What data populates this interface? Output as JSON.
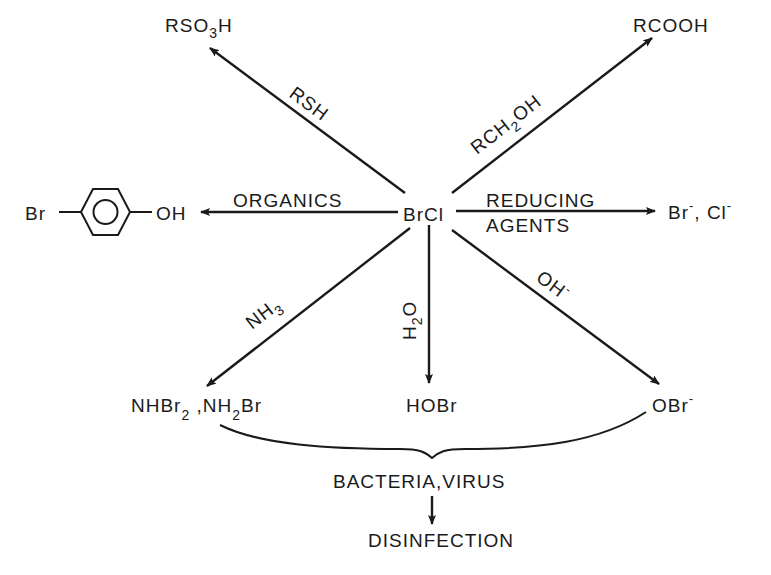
{
  "diagram": {
    "type": "reaction-scheme",
    "center": {
      "label": "BrCl"
    },
    "reactions": [
      {
        "reagent": "RSH",
        "product": "RSO3H",
        "product_parts": [
          "RSO",
          "3",
          "H"
        ],
        "direction": "upper-left"
      },
      {
        "reagent": "RCH2OH",
        "reagent_parts": [
          "RCH",
          "2",
          "OH"
        ],
        "product": "RCOOH",
        "direction": "upper-right"
      },
      {
        "reagent": "ORGANICS",
        "product": "Br-C6H4-OH",
        "product_parts": [
          "Br",
          "OH"
        ],
        "direction": "left"
      },
      {
        "reagent": "REDUCING AGENTS",
        "reagent_parts": [
          "REDUCING",
          "AGENTS"
        ],
        "product": "Br-, Cl-",
        "product_parts": [
          "Br",
          "-",
          ", Cl",
          "-"
        ],
        "direction": "right"
      },
      {
        "reagent": "NH3",
        "reagent_parts": [
          "NH",
          "3"
        ],
        "product": "NHBr2, NH2Br",
        "product_parts": [
          "NHBr",
          "2",
          " ,NH",
          "2",
          "Br"
        ],
        "direction": "lower-left"
      },
      {
        "reagent": "H2O",
        "reagent_parts": [
          "H",
          "2",
          "O"
        ],
        "product": "HOBr",
        "direction": "down"
      },
      {
        "reagent": "OH-",
        "reagent_parts": [
          "OH",
          "-"
        ],
        "product": "OBr-",
        "product_parts": [
          "OBr",
          "-"
        ],
        "direction": "lower-right"
      }
    ],
    "grouped_target": "BACTERIA,VIRUS",
    "outcome": "DISINFECTION"
  }
}
